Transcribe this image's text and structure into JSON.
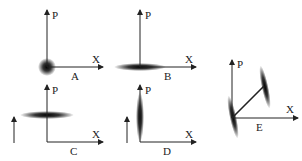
{
  "figure": {
    "colors": {
      "axis": "#222222",
      "blob": "#000000",
      "background": "#ffffff"
    },
    "panels": [
      {
        "id": "A",
        "label": "A",
        "x_axis": "X",
        "y_axis": "P",
        "blob": "circular spot at origin"
      },
      {
        "id": "B",
        "label": "B",
        "x_axis": "X",
        "y_axis": "P",
        "blob": "horizontally squeezed ellipse at origin"
      },
      {
        "id": "C",
        "label": "C",
        "x_axis": "X",
        "y_axis": "P",
        "blob": "horizontal ellipse displaced along P",
        "side_arrow": "upward arrow"
      },
      {
        "id": "D",
        "label": "D",
        "x_axis": "X",
        "y_axis": "P",
        "blob": "vertically squeezed ellipse displaced along P",
        "side_arrow": "upward arrow"
      },
      {
        "id": "E",
        "label": "E",
        "x_axis": "X",
        "y_axis": "P",
        "blob": "tilted ellipses, one at origin and one displaced diagonally, joined by a line"
      }
    ]
  }
}
